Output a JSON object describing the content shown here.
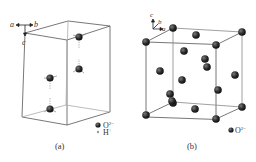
{
  "figure": {
    "panels": [
      {
        "id": "a",
        "caption": "(a)",
        "axes": {
          "a": "a",
          "b": "b",
          "c": "c"
        },
        "legend": [
          {
            "symbol": "large-dark-sphere",
            "label": "O",
            "superscript": "2−"
          },
          {
            "symbol": "small-light-sphere",
            "label": "H",
            "superscript": "+"
          }
        ]
      },
      {
        "id": "b",
        "caption": "(b)",
        "axes": {
          "a": "a",
          "b": "b",
          "c": "c"
        },
        "legend": [
          {
            "symbol": "large-dark-sphere",
            "label": "O",
            "superscript": "2−"
          }
        ]
      }
    ]
  },
  "colors": {
    "atom": "#2b2b2b",
    "edge": "#555555",
    "background": "#ffffff"
  }
}
